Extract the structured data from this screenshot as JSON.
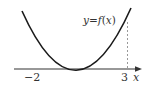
{
  "diagram": {
    "curve_label": "y = f(x)",
    "curve_label_parts": {
      "y": "y",
      "eq": "=",
      "f": "f",
      "open": "(",
      "x": "x",
      "close": ")"
    },
    "axis_label": "x",
    "root_left_label": "−2",
    "dashed_mark_label": "3",
    "colors": {
      "curve": "#1a1a1a",
      "axis": "#333333",
      "dashed": "#999999",
      "text": "#333333"
    },
    "roots": [
      -2,
      3
    ],
    "shape": "upward parabola"
  }
}
